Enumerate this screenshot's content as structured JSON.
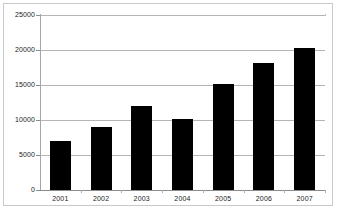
{
  "chart_data": {
    "type": "bar",
    "title": "",
    "xlabel": "",
    "ylabel": "",
    "categories": [
      "2001",
      "2002",
      "2003",
      "2004",
      "2005",
      "2006",
      "2007"
    ],
    "values": [
      7000,
      9000,
      12000,
      10100,
      15200,
      18200,
      20300
    ],
    "series": [
      {
        "name": "",
        "values": [
          7000,
          9000,
          12000,
          10100,
          15200,
          18200,
          20300
        ]
      }
    ],
    "ylim": [
      0,
      25000
    ],
    "y_ticks": [
      0,
      5000,
      10000,
      15000,
      20000,
      25000
    ],
    "y_tick_labels": [
      "0",
      "5000",
      "10000",
      "15000",
      "20000",
      "25000"
    ],
    "grid": true,
    "legend": false,
    "legend_position": "none",
    "bar_color": "#000000",
    "gridline_color": "#b4b4b4",
    "plot_background": "#ffffff",
    "frame_color": "#c9c9c9"
  },
  "axes": {
    "y_axis_name": "y-axis",
    "x_axis_name": "x-axis"
  }
}
